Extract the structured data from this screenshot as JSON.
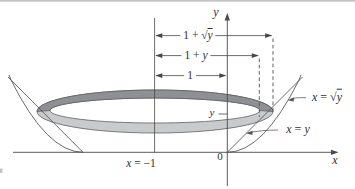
{
  "figure": {
    "labels": {
      "axis_y": [
        {
          "t": "y",
          "it": true
        }
      ],
      "axis_x": [
        {
          "t": "x",
          "it": true
        }
      ],
      "dim_outer": [
        {
          "t": "1 + "
        },
        {
          "t": "√"
        },
        {
          "t": "y",
          "it": true,
          "rad": true
        }
      ],
      "dim_inner": [
        {
          "t": "1 + "
        },
        {
          "t": "y",
          "it": true
        }
      ],
      "dim_one": [
        {
          "t": "1"
        }
      ],
      "y_tick": [
        {
          "t": "y",
          "it": true
        }
      ],
      "curve_sqrt": [
        {
          "t": "x",
          "it": true
        },
        {
          "t": " = "
        },
        {
          "t": "√"
        },
        {
          "t": "y",
          "it": true,
          "rad": true
        }
      ],
      "curve_line": [
        {
          "t": "x",
          "it": true
        },
        {
          "t": " = "
        },
        {
          "t": "y",
          "it": true
        }
      ],
      "axis_of_rotation": [
        {
          "t": "x",
          "it": true
        },
        {
          "t": " = −1"
        }
      ],
      "origin": [
        {
          "t": "0"
        }
      ]
    },
    "colors": {
      "ring_top_face": "#8e9093",
      "ring_bottom_face": "#c8cacb",
      "ring_stroke": "#5d5f61",
      "line": "#4a4a4a",
      "text": "#303030",
      "page_rule": "#aeb0b1"
    }
  }
}
